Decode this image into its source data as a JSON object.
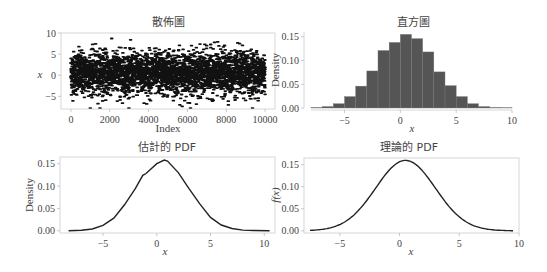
{
  "chart_data": [
    {
      "id": "scatter",
      "type": "scatter",
      "title": "散佈圖",
      "xlabel": "Index",
      "ylabel": "x",
      "xlim": [
        -200,
        10200
      ],
      "ylim": [
        -8,
        10
      ],
      "xticks": [
        0,
        2000,
        4000,
        6000,
        8000,
        10000
      ],
      "yticks": [
        -5,
        0,
        5,
        10
      ],
      "n_points": 10000,
      "distribution": {
        "mean": 0.5,
        "std": 2.5
      },
      "marker_color": "#111111",
      "grid": false,
      "frame": "box"
    },
    {
      "id": "histogram",
      "type": "bar",
      "title": "直方圖",
      "xlabel": "x",
      "ylabel": "Density",
      "xlim": [
        -8,
        10
      ],
      "ylim": [
        0,
        0.16
      ],
      "xticks": [
        -5,
        0,
        5,
        10
      ],
      "yticks": [
        0.0,
        0.05,
        0.1,
        0.15
      ],
      "bin_edges": [
        -8,
        -7,
        -6,
        -5,
        -4,
        -3,
        -2,
        -1,
        0,
        1,
        2,
        3,
        4,
        5,
        6,
        7,
        8,
        9,
        10
      ],
      "values": [
        0.001,
        0.003,
        0.009,
        0.024,
        0.046,
        0.078,
        0.121,
        0.138,
        0.155,
        0.146,
        0.118,
        0.076,
        0.047,
        0.024,
        0.009,
        0.003,
        0.001,
        0.0005
      ],
      "bar_color": "#555555",
      "grid": false,
      "frame": "left-bottom"
    },
    {
      "id": "estimated-pdf",
      "type": "line",
      "title": "估計的 PDF",
      "xlabel": "x",
      "ylabel": "Density",
      "xlim": [
        -9,
        11
      ],
      "ylim": [
        -0.005,
        0.165
      ],
      "xticks": [
        -5,
        0,
        5,
        10
      ],
      "yticks": [
        0.0,
        0.05,
        0.1,
        0.15
      ],
      "x": [
        -8.2,
        -7,
        -6,
        -5,
        -4,
        -3,
        -2,
        -1.3,
        -1,
        0,
        0.7,
        1,
        2,
        3,
        4,
        5,
        6,
        7,
        8,
        9,
        10.5
      ],
      "y": [
        0.0,
        0.001,
        0.004,
        0.012,
        0.028,
        0.058,
        0.094,
        0.124,
        0.128,
        0.15,
        0.158,
        0.156,
        0.13,
        0.094,
        0.06,
        0.03,
        0.013,
        0.005,
        0.0015,
        0.0005,
        0.0
      ],
      "line_color": "#222222",
      "grid": false,
      "frame": "box"
    },
    {
      "id": "theoretical-pdf",
      "type": "line",
      "title": "理論的 PDF",
      "xlabel": "x",
      "ylabel": "f(x)",
      "xlim": [
        -8,
        10
      ],
      "ylim": [
        -0.005,
        0.165
      ],
      "xticks": [
        -5,
        0,
        5,
        10
      ],
      "yticks": [
        0.0,
        0.05,
        0.1,
        0.15
      ],
      "distribution": {
        "mean": 0.5,
        "std": 2.5
      },
      "x_range": [
        -7.5,
        9.5
      ],
      "line_color": "#222222",
      "grid": false,
      "frame": "box"
    }
  ],
  "labels": {
    "scatter_title": "散佈圖",
    "hist_title": "直方圖",
    "est_title": "估計的 PDF",
    "theo_title": "理論的 PDF",
    "index_label": "Index",
    "x_label": "x",
    "density_label": "Density",
    "fx_label": "f(x)"
  }
}
